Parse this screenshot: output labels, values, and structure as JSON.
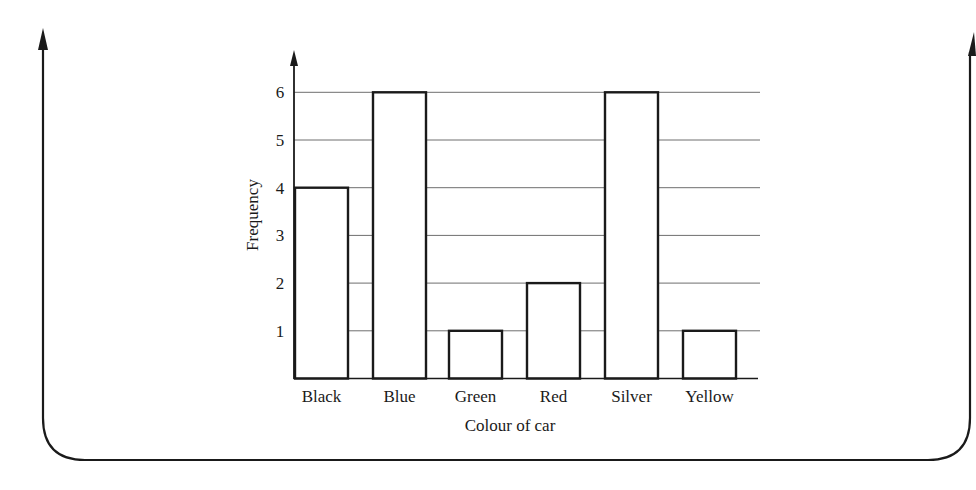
{
  "chart_data": {
    "type": "bar",
    "title": "",
    "xlabel": "Colour of car",
    "ylabel": "Frequency",
    "categories": [
      "Black",
      "Blue",
      "Green",
      "Red",
      "Silver",
      "Yellow"
    ],
    "values": [
      4,
      6,
      1,
      2,
      6,
      1
    ],
    "yticks": [
      1,
      2,
      3,
      4,
      5,
      6
    ],
    "ylim": [
      0,
      6
    ],
    "grid": true,
    "legend": null,
    "bar_fill": "#ffffff",
    "bar_stroke": "#1a1a1a",
    "gridline_color": "#6e6e6e"
  },
  "frame": {
    "stroke": "#1a1a1a",
    "left_arrow": true,
    "right_arrow": true
  }
}
